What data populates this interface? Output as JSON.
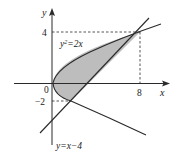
{
  "figure": {
    "type": "region-between-curves",
    "colors": {
      "stroke": "#2a2a2a",
      "fill": "#bdbdbd",
      "background": "#ffffff"
    },
    "axes": {
      "x_label": "x",
      "y_label": "y",
      "origin_label": "0"
    },
    "ticks": {
      "x": [
        {
          "value": 8,
          "label": "8"
        }
      ],
      "y": [
        {
          "value": 4,
          "label": "4"
        },
        {
          "value": -2,
          "label": "−2"
        }
      ]
    },
    "curves": [
      {
        "name": "parabola",
        "label_base": "y",
        "label_sup": "2",
        "label_rest": "=2x"
      },
      {
        "name": "line",
        "label": "y=x−4"
      }
    ],
    "intersections": [
      {
        "x": 8,
        "y": 4
      },
      {
        "x": 2,
        "y": -2
      }
    ]
  }
}
